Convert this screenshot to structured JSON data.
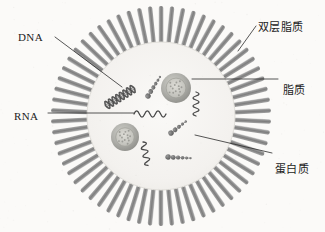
{
  "figure": {
    "background_color": "#fbfaf8",
    "interior_color": "#f6f4f1",
    "spike_color": "#8a8a8a",
    "spike_highlight_color": "#c9c9c9",
    "leader_color": "#2b2b2b",
    "center": {
      "x": 161,
      "y": 116
    },
    "inner_radius": 74,
    "outer_radius": 110,
    "spike_count": 62
  },
  "labels": {
    "dna": {
      "text": "DNA",
      "x": 18,
      "y": 31,
      "script": "latin"
    },
    "rna": {
      "text": "RNA",
      "x": 14,
      "y": 110,
      "script": "latin"
    },
    "bilayer": {
      "text": "双层脂质",
      "x": 258,
      "y": 18,
      "script": "cjk"
    },
    "lipid": {
      "text": "脂质",
      "x": 283,
      "y": 81,
      "script": "cjk"
    },
    "protein": {
      "text": "蛋白质",
      "x": 275,
      "y": 160,
      "script": "cjk"
    }
  },
  "leaders": {
    "dna": {
      "x1": 55,
      "y1": 37,
      "x2": 122,
      "y2": 87
    },
    "rna": {
      "x1": 48,
      "y1": 113,
      "x2": 134,
      "y2": 113
    },
    "bilayer": {
      "x1": 256,
      "y1": 26,
      "x2": 238,
      "y2": 51
    },
    "lipid": {
      "x1": 278,
      "y1": 79,
      "x2": 192,
      "y2": 79
    },
    "protein": {
      "x1": 272,
      "y1": 153,
      "x2": 195,
      "y2": 135
    }
  },
  "contents": {
    "dna_helix": {
      "name": "DNA double helix",
      "x": 120,
      "y": 97,
      "angle": -32,
      "turns": 4
    },
    "rna_strands": [
      {
        "name": "RNA zigzag strand",
        "x": 134,
        "y": 114,
        "length": 32,
        "angle": 0
      },
      {
        "name": "RNA zigzag strand",
        "x": 196,
        "y": 92,
        "length": 24,
        "angle": 90
      },
      {
        "name": "RNA zigzag strand",
        "x": 143,
        "y": 142,
        "length": 24,
        "angle": 78
      }
    ],
    "vesicles": [
      {
        "name": "lipid vesicle",
        "x": 176,
        "y": 88,
        "r": 15
      },
      {
        "name": "lipid vesicle",
        "x": 125,
        "y": 137,
        "r": 14
      }
    ],
    "protein_chains": [
      {
        "name": "protein bead chain",
        "x": 148,
        "y": 96,
        "angle": -58,
        "beads": 6
      },
      {
        "name": "protein bead chain",
        "x": 171,
        "y": 133,
        "angle": -38,
        "beads": 5
      },
      {
        "name": "protein bead chain",
        "x": 168,
        "y": 157,
        "angle": 3,
        "beads": 6
      }
    ]
  },
  "colors": {
    "ink": "#1c1c1c",
    "vesicle_fill": "#a8a8a8",
    "vesicle_core": "#c5c5c0",
    "bead": "#6f6f6f",
    "strand": "#4a4a4a"
  }
}
